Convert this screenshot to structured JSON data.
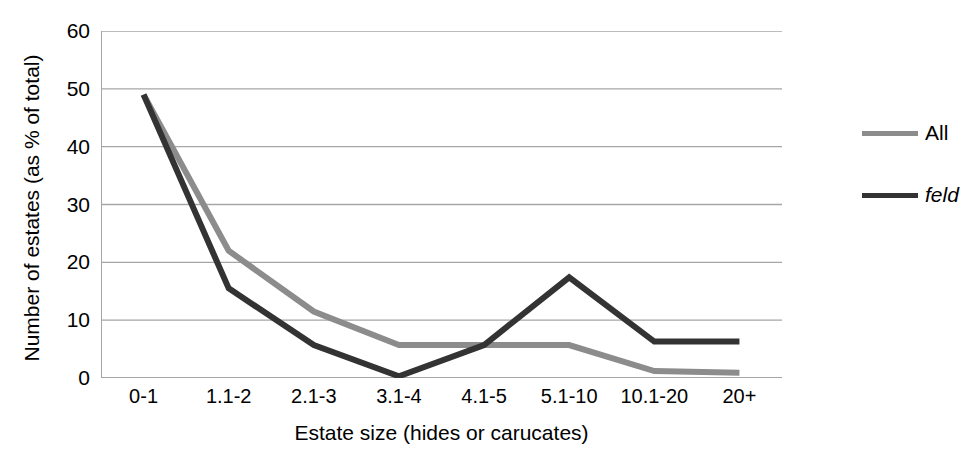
{
  "chart_data": {
    "type": "line",
    "title": "",
    "xlabel": "Estate size (hides or carucates)",
    "ylabel": "Number of estates (as % of total)",
    "categories": [
      "0-1",
      "1.1-2",
      "2.1-3",
      "3.1-4",
      "4.1-5",
      "5.1-10",
      "10.1-20",
      "20+"
    ],
    "ylim": [
      0,
      60
    ],
    "yticks": [
      0,
      10,
      20,
      30,
      40,
      50,
      60
    ],
    "grid": true,
    "legend_position": "right",
    "series": [
      {
        "name": "All",
        "color": "#8c8c8c",
        "italic": false,
        "values": [
          49.0,
          22.0,
          11.5,
          5.7,
          5.7,
          5.7,
          1.2,
          0.9
        ]
      },
      {
        "name": "feld",
        "color": "#333333",
        "italic": true,
        "values": [
          49.0,
          15.5,
          5.7,
          0.3,
          5.7,
          17.4,
          6.3,
          6.3
        ]
      }
    ]
  },
  "axis": {
    "y_tick_labels": [
      "60",
      "50",
      "40",
      "30",
      "20",
      "10",
      "0"
    ]
  },
  "style": {
    "axis_color": "#a6a6a6",
    "grid_color": "#a6a6a6",
    "text_color": "#000000",
    "background": "#ffffff"
  }
}
